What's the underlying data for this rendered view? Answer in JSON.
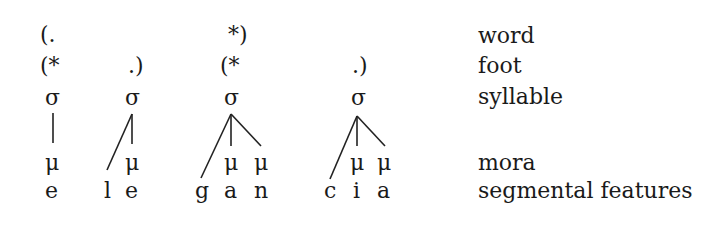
{
  "tiers": {
    "word": {
      "label": "word"
    },
    "foot": {
      "label": "foot"
    },
    "syllable": {
      "label": "syllable"
    },
    "mora": {
      "label": "mora"
    },
    "segmental": {
      "label": "segmental features"
    }
  },
  "grid": {
    "word": [
      "(.",
      "*)"
    ],
    "foot": [
      "(*",
      ".)",
      "(*",
      ".)"
    ]
  },
  "syllables": [
    {
      "symbol": "σ",
      "moras": [
        "μ"
      ],
      "segments": [
        "e"
      ]
    },
    {
      "symbol": "σ",
      "moras": [
        "μ"
      ],
      "segments": [
        "l",
        "e"
      ]
    },
    {
      "symbol": "σ",
      "moras": [
        "μ",
        "μ"
      ],
      "segments": [
        "g",
        "a",
        "n"
      ]
    },
    {
      "symbol": "σ",
      "moras": [
        "μ",
        "μ"
      ],
      "segments": [
        "c",
        "i",
        "a"
      ]
    }
  ]
}
